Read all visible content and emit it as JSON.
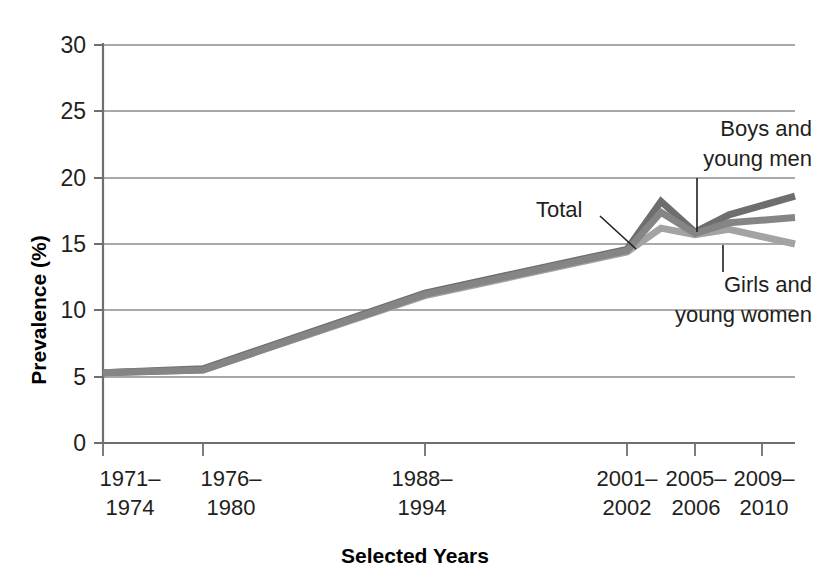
{
  "chart_data": {
    "type": "line",
    "title": "",
    "xlabel": "Selected Years",
    "ylabel": "Prevalence (%)",
    "ylim": [
      0,
      30
    ],
    "yticks": [
      0,
      5,
      10,
      15,
      20,
      25,
      30
    ],
    "ytick_labels": [
      "0",
      "5",
      "10",
      "15",
      "20",
      "25",
      "30"
    ],
    "grid": true,
    "legend_position": "inline-annotations",
    "categories": [
      "1971–\n1974",
      "1976–\n1980",
      "1988–\n1994",
      "2001–\n2002",
      "2003–\n2004",
      "2005–\n2006",
      "2007–\n2008",
      "2009–\n2010"
    ],
    "xtick_labels": [
      {
        "line1": "1971–",
        "line2": "1974"
      },
      {
        "line1": "1976–",
        "line2": "1980"
      },
      {
        "line1": "1988–",
        "line2": "1994"
      },
      {
        "line1": "2001–",
        "line2": "2002"
      },
      {
        "line1": "2005–",
        "line2": "2006"
      },
      {
        "line1": "2009–",
        "line2": "2010"
      }
    ],
    "series": [
      {
        "name": "Boys and young men",
        "label_line1": "Boys and",
        "label_line2": "young men",
        "color": "#6e6e6e",
        "values": [
          5.3,
          5.6,
          11.3,
          14.6,
          18.2,
          15.9,
          17.2,
          18.6
        ]
      },
      {
        "name": "Total",
        "label_line1": "Total",
        "label_line2": "",
        "color": "#858585",
        "values": [
          5.3,
          5.5,
          11.2,
          14.5,
          17.4,
          15.8,
          16.6,
          17.0
        ]
      },
      {
        "name": "Girls and young women",
        "label_line1": "Girls and",
        "label_line2": "young women",
        "color": "#a3a3a3",
        "values": [
          5.3,
          5.5,
          11.1,
          14.4,
          16.2,
          15.7,
          16.1,
          15.0
        ]
      }
    ],
    "annotations": [
      {
        "id": "total",
        "text_line1": "Total",
        "text_line2": ""
      },
      {
        "id": "boys",
        "text_line1": "Boys and",
        "text_line2": "young men"
      },
      {
        "id": "girls",
        "text_line1": "Girls and",
        "text_line2": "young women"
      }
    ],
    "axis_color": "#808080",
    "grid_color": "#8c8c8c"
  }
}
